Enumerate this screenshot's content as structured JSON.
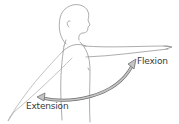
{
  "diagram": {
    "labels": {
      "flexion": "Flexion",
      "extension": "Extension"
    },
    "colors": {
      "line": "#8a8a8a",
      "arrow_fill": "#b8b8b8",
      "arrow_stroke": "#6e6e6e",
      "text": "#3a3a3a"
    }
  }
}
